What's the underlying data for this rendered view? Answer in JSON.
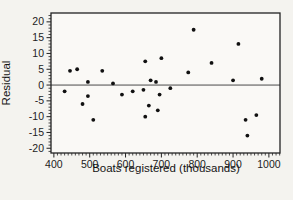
{
  "figure": {
    "background": "#f4f3ef",
    "plot_background": "#faf9f6",
    "axis_color": "#222222",
    "zero_line_color": "#4a4a4a",
    "point_color": "#111111"
  },
  "chart_data": {
    "type": "scatter",
    "title": "",
    "xlabel": "Boats registered (thousands)",
    "ylabel": "Residual",
    "xlim": [
      392,
      1031
    ],
    "ylim": [
      -21.5,
      22.8
    ],
    "x_ticks": [
      400,
      500,
      600,
      700,
      800,
      900,
      1000
    ],
    "y_ticks": [
      20,
      15,
      10,
      5,
      0,
      -5,
      -10,
      -15,
      -20
    ],
    "x_minor_step": 10,
    "y_minor_step": 1,
    "zero_line": 0,
    "grid": false,
    "legend_position": "none",
    "points": [
      [
        430,
        -2
      ],
      [
        445,
        4.5
      ],
      [
        465,
        5
      ],
      [
        480,
        -6
      ],
      [
        495,
        1
      ],
      [
        495,
        -3.5
      ],
      [
        510,
        -11
      ],
      [
        535,
        4.5
      ],
      [
        565,
        0.5
      ],
      [
        590,
        -3
      ],
      [
        620,
        -2
      ],
      [
        650,
        -1.5
      ],
      [
        655,
        7.5
      ],
      [
        655,
        -10
      ],
      [
        665,
        -6.5
      ],
      [
        670,
        1.5
      ],
      [
        685,
        1
      ],
      [
        690,
        -8
      ],
      [
        695,
        -3
      ],
      [
        700,
        8.5
      ],
      [
        725,
        -1
      ],
      [
        775,
        4
      ],
      [
        790,
        17.5
      ],
      [
        840,
        7
      ],
      [
        900,
        1.5
      ],
      [
        915,
        13
      ],
      [
        935,
        -11
      ],
      [
        940,
        -16
      ],
      [
        965,
        -9.5
      ],
      [
        980,
        2
      ]
    ]
  }
}
